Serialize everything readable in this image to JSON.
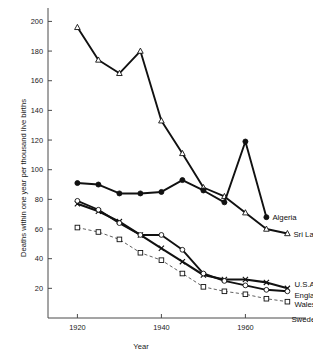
{
  "chart_data": {
    "type": "line",
    "title": "",
    "subtitle": "",
    "xlabel": "Year",
    "ylabel": "Deaths within one year per thousand live births",
    "xlim": [
      1913,
      1973
    ],
    "ylim": [
      0,
      205
    ],
    "xticks": [
      1920,
      1940,
      1960
    ],
    "xtick_labels": [
      "1920",
      "1940",
      "1960"
    ],
    "yticks": [
      20,
      40,
      60,
      80,
      100,
      120,
      140,
      160,
      180,
      200
    ],
    "ytick_labels": [
      "20",
      "40",
      "60",
      "80",
      "100",
      "120",
      "140",
      "160",
      "180",
      "200"
    ],
    "grid": false,
    "legend": "inline-right-of-series-end",
    "series": [
      {
        "name": "Sri Lanka (Ceylon)",
        "label": "Sri Lanka (Ceylon)",
        "marker": "open-triangle",
        "line": "solid",
        "x": [
          1920,
          1925,
          1930,
          1935,
          1940,
          1945,
          1950,
          1955,
          1960,
          1965,
          1970
        ],
        "values": [
          196,
          174,
          165,
          180,
          133,
          111,
          88,
          82,
          71,
          60,
          57
        ]
      },
      {
        "name": "Algeria",
        "label": "Algeria",
        "marker": "filled-circle",
        "line": "solid",
        "x": [
          1920,
          1925,
          1930,
          1935,
          1940,
          1945,
          1950,
          1955,
          1960,
          1965
        ],
        "values": [
          91,
          90,
          84,
          84,
          85,
          93,
          86,
          78,
          119,
          68
        ]
      },
      {
        "name": "U.S.A",
        "label": "U.S.A",
        "marker": "cross",
        "line": "solid",
        "x": [
          1920,
          1925,
          1930,
          1935,
          1940,
          1945,
          1950,
          1955,
          1960,
          1965,
          1970
        ],
        "values": [
          77,
          72,
          65,
          56,
          47,
          38,
          29,
          26,
          26,
          24,
          20
        ]
      },
      {
        "name": "England and Wales",
        "label": "England and Wales",
        "marker": "open-circle",
        "line": "solid",
        "x": [
          1920,
          1925,
          1930,
          1935,
          1940,
          1945,
          1950,
          1955,
          1960,
          1965,
          1970
        ],
        "values": [
          79,
          73,
          64,
          56,
          56,
          46,
          30,
          25,
          22,
          19,
          18
        ]
      },
      {
        "name": "Sweden",
        "label": "Sweden",
        "marker": "open-square",
        "line": "dashed",
        "x": [
          1920,
          1925,
          1930,
          1935,
          1940,
          1945,
          1950,
          1955,
          1960,
          1965,
          1970
        ],
        "values": [
          61,
          58,
          53,
          44,
          39,
          30,
          21,
          18,
          16,
          13,
          11
        ]
      }
    ]
  }
}
